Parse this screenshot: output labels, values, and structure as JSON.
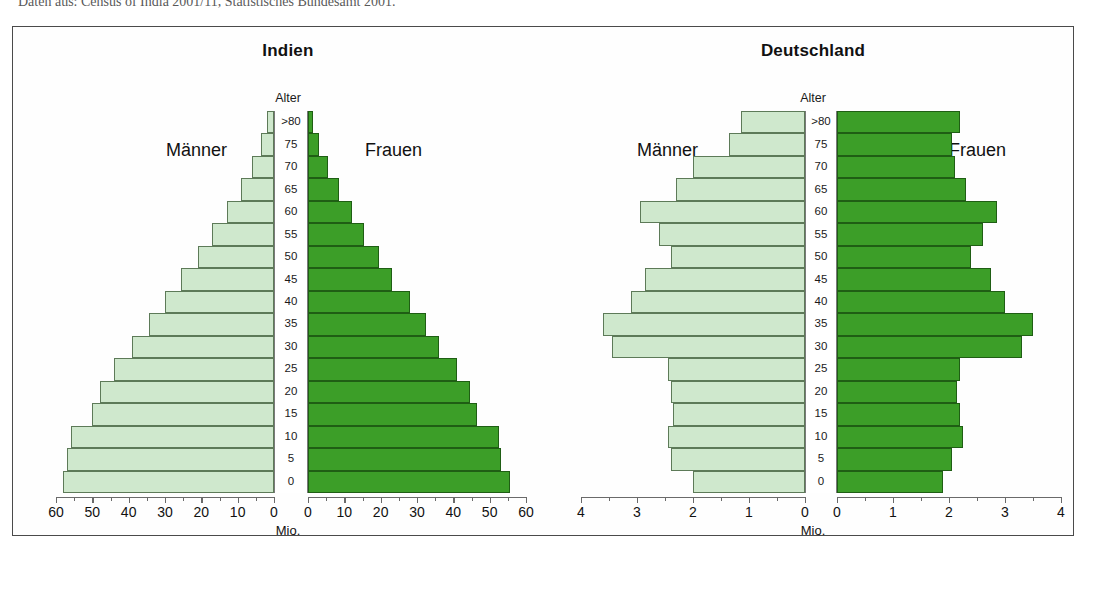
{
  "source_note": "Daten aus: Census of India 2001/11, Statistisches Bundesamt 2001.",
  "panels": [
    {
      "id": "indien",
      "title": "Indien",
      "alter_label": "Alter",
      "male_label": "Männer",
      "female_label": "Frauen",
      "unit_label": "Mio."
    },
    {
      "id": "deutschland",
      "title": "Deutschland",
      "alter_label": "Alter",
      "male_label": "Männer",
      "female_label": "Frauen",
      "unit_label": "Mio."
    }
  ],
  "colors": {
    "male_fill": "#cfe8cd",
    "male_stroke": "#5d7a58",
    "female_fill": "#3c9e28",
    "female_stroke": "#1f5e14",
    "frame": "#4a4a4a",
    "text": "#111111"
  },
  "chart_data": [
    {
      "type": "bar",
      "title": "Indien",
      "subtitle": "Bevölkerungspyramide",
      "orientation": "horizontal-diverging",
      "xlabel": "Mio.",
      "ylabel": "Alter",
      "xlim": [
        0,
        60
      ],
      "xticks": [
        0,
        10,
        20,
        30,
        40,
        50,
        60
      ],
      "xticklabels": [
        "0",
        "10",
        "20",
        "30",
        "40",
        "50",
        "60"
      ],
      "grid": false,
      "legend": [
        "Männer",
        "Frauen"
      ],
      "legend_position": "inside-left-and-right",
      "categories": [
        "0",
        "5",
        "10",
        "15",
        "20",
        "25",
        "30",
        "35",
        "40",
        "45",
        "50",
        "55",
        "60",
        "65",
        "70",
        "75",
        ">80"
      ],
      "series": [
        {
          "name": "Männer",
          "side": "left",
          "values": [
            58.0,
            57.0,
            56.0,
            50.0,
            48.0,
            44.0,
            39.0,
            34.5,
            30.0,
            25.5,
            21.0,
            17.0,
            13.0,
            9.0,
            6.0,
            3.5,
            2.0
          ]
        },
        {
          "name": "Frauen",
          "side": "right",
          "values": [
            55.5,
            53.0,
            52.5,
            46.5,
            44.5,
            41.0,
            36.0,
            32.5,
            28.0,
            23.0,
            19.5,
            15.5,
            12.0,
            8.5,
            5.5,
            3.0,
            1.5
          ]
        }
      ]
    },
    {
      "type": "bar",
      "title": "Deutschland",
      "subtitle": "Bevölkerungspyramide",
      "orientation": "horizontal-diverging",
      "xlabel": "Mio.",
      "ylabel": "Alter",
      "xlim": [
        0,
        4
      ],
      "xticks": [
        0,
        1,
        2,
        3,
        4
      ],
      "xticklabels": [
        "0",
        "1",
        "2",
        "3",
        "4"
      ],
      "grid": false,
      "legend": [
        "Männer",
        "Frauen"
      ],
      "legend_position": "inside-left-and-right",
      "categories": [
        "0",
        "5",
        "10",
        "15",
        "20",
        "25",
        "30",
        "35",
        "40",
        "45",
        "50",
        "55",
        "60",
        "65",
        "70",
        "75",
        ">80"
      ],
      "series": [
        {
          "name": "Männer",
          "side": "left",
          "values": [
            2.0,
            2.4,
            2.45,
            2.35,
            2.4,
            2.45,
            3.45,
            3.6,
            3.1,
            2.85,
            2.4,
            2.6,
            2.95,
            2.3,
            2.0,
            1.35,
            1.15
          ]
        },
        {
          "name": "Frauen",
          "side": "right",
          "values": [
            1.9,
            2.05,
            2.25,
            2.2,
            2.15,
            2.2,
            3.3,
            3.5,
            3.0,
            2.75,
            2.4,
            2.6,
            2.85,
            2.3,
            2.1,
            2.05,
            2.2
          ]
        }
      ]
    }
  ]
}
